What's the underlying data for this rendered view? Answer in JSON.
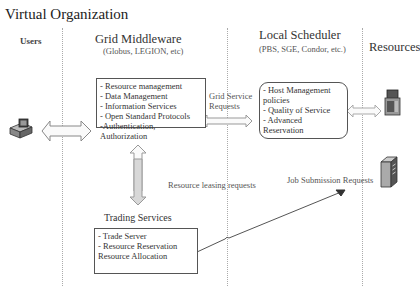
{
  "title": "Virtual Organization",
  "columns": {
    "users": {
      "label": "Users"
    },
    "grid_middleware": {
      "label": "Grid Middleware",
      "sub": "(Globus, LEGION, etc)"
    },
    "local_scheduler": {
      "label": "Local Scheduler",
      "sub": "(PBS, SGE, Condor, etc.)"
    },
    "resources": {
      "label": "Resources"
    }
  },
  "middleware_box": {
    "items": [
      "- Resource management",
      "- Data Management",
      "- Information Services",
      "- Open Standard Protocols",
      "-Authentication, Authorization"
    ]
  },
  "scheduler_box": {
    "items": [
      "- Host Management",
      "policies",
      "- Quality of Service",
      "- Advanced Reservation"
    ]
  },
  "trading": {
    "label": "Trading Services",
    "items": [
      "- Trade Server",
      "- Resource Reservation",
      "Resource Allocation"
    ]
  },
  "labels": {
    "grid_service_requests_1": "Grid Service",
    "grid_service_requests_2": "Requests",
    "resource_leasing": "Resource leasing requests",
    "job_submission": "Job Submission Requests"
  },
  "icons": {
    "user": "user-workstation-icon",
    "resource_top": "resource-server-icon",
    "resource_bottom": "server-tower-icon"
  }
}
